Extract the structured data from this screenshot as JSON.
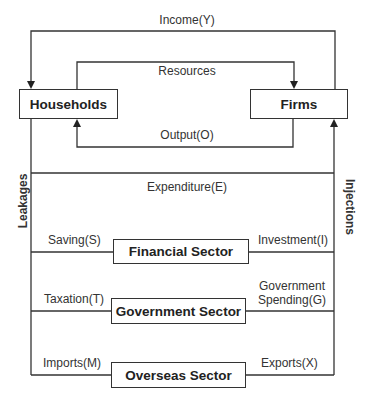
{
  "diagram": {
    "type": "circular-flow-of-income",
    "nodes": {
      "households": "Households",
      "firms": "Firms",
      "financial": "Financial Sector",
      "government": "Government Sector",
      "overseas": "Overseas Sector"
    },
    "flows": {
      "income": "Income(Y)",
      "resources": "Resources",
      "output": "Output(O)",
      "expenditure": "Expenditure(E)",
      "saving": "Saving(S)",
      "investment": "Investment(I)",
      "taxation": "Taxation(T)",
      "gov_spending_line1": "Government",
      "gov_spending_line2": "Spending(G)",
      "imports": "Imports(M)",
      "exports": "Exports(X)"
    },
    "side_labels": {
      "left": "Leakages",
      "right": "Injections"
    },
    "edges": [
      {
        "from": "Firms",
        "to": "Households",
        "label": "Income(Y)"
      },
      {
        "from": "Households",
        "to": "Firms",
        "label": "Resources"
      },
      {
        "from": "Firms",
        "to": "Households",
        "label": "Output(O)"
      },
      {
        "from": "Households",
        "to": "Firms",
        "label": "Expenditure(E)"
      },
      {
        "from": "Households",
        "to": "Financial Sector",
        "label": "Saving(S)"
      },
      {
        "from": "Financial Sector",
        "to": "Firms",
        "label": "Investment(I)"
      },
      {
        "from": "Households",
        "to": "Government Sector",
        "label": "Taxation(T)"
      },
      {
        "from": "Government Sector",
        "to": "Firms",
        "label": "Government Spending(G)"
      },
      {
        "from": "Households",
        "to": "Overseas Sector",
        "label": "Imports(M)"
      },
      {
        "from": "Overseas Sector",
        "to": "Firms",
        "label": "Exports(X)"
      }
    ]
  }
}
